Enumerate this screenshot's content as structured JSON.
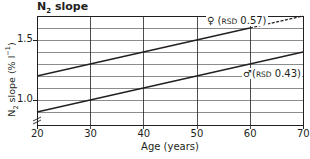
{
  "chart_data": {
    "type": "line",
    "title": "N2 slope",
    "title_main": "N",
    "title_sub": "2",
    "title_rest": " slope",
    "xlabel": "Age (years)",
    "ylabel": "N2 slope (% l-1)",
    "ylabel_parts": {
      "a": "N",
      "sub": "2",
      "b": " slope (% l",
      "sup": "−1",
      "c": ")"
    },
    "xlim": [
      20,
      70
    ],
    "ylim": [
      0.9,
      1.7
    ],
    "y_axis_break": true,
    "grid": true,
    "x_ticks": [
      "20",
      "30",
      "40",
      "50",
      "60",
      "70"
    ],
    "y_ticks": [
      "1.0",
      "1.5"
    ],
    "series": [
      {
        "name": "♀ (RSD 0.57)",
        "sex": "female",
        "rsd": 0.57,
        "x": [
          20,
          30,
          40,
          50,
          60,
          70
        ],
        "values": [
          1.2,
          1.3,
          1.4,
          1.5,
          1.6,
          1.7
        ],
        "solid_until": 60,
        "dashed_from": 60
      },
      {
        "name": "♂ (RSD 0.43)",
        "sex": "male",
        "rsd": 0.43,
        "x": [
          20,
          30,
          40,
          50,
          60,
          70
        ],
        "values": [
          0.9,
          1.0,
          1.1,
          1.2,
          1.3,
          1.4
        ]
      }
    ],
    "annotations": [
      {
        "symbol": "♀",
        "prefix": "(",
        "rsd_label": "RSD",
        "value": " 0.57)"
      },
      {
        "symbol": "♂",
        "prefix": "(",
        "rsd_label": "RSD",
        "value": " 0.43)"
      }
    ]
  }
}
